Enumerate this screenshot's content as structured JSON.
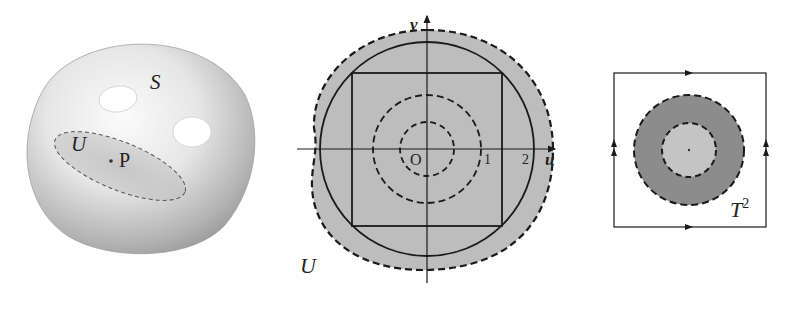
{
  "figure_left": {
    "title": "surface",
    "surface_label": "S",
    "neighborhood_label": "U",
    "point_label": "P",
    "holes": 2
  },
  "figure_middle": {
    "axis_u_label": "u",
    "axis_v_label": "v",
    "origin_label": "O",
    "tick_1": "1",
    "tick_2": "2",
    "region_label": "U"
  },
  "figure_right": {
    "torus_label": "T",
    "torus_exponent": "2"
  },
  "colors": {
    "ink": "#1a1a1a",
    "region_fill": "#bdbdbd",
    "dark_annulus": "#8c8c8c",
    "light_disk": "#c4c4c4",
    "surface_light": "#f2f2f2",
    "surface_dark": "#9a9a9a"
  }
}
